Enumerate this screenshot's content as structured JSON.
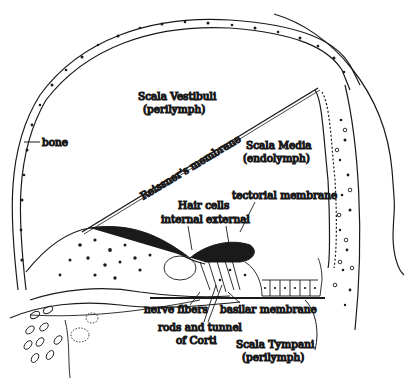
{
  "diagram": {
    "regions": {
      "scala_vestibuli": {
        "name": "Scala Vestibuli",
        "fluid": "(perilymph)"
      },
      "scala_media": {
        "name": "Scala Media",
        "fluid": "(endolymph)"
      },
      "scala_tympani": {
        "name": "Scala Tympani",
        "fluid": "(perilymph)"
      }
    },
    "labels": {
      "bone": "bone",
      "reissners_membrane": "Reissner's membrane",
      "hair_cells": "Hair cells",
      "internal": "internal",
      "external": "external",
      "tectorial_membrane": "tectorial membrane",
      "nerve_fibers": "nerve fibers",
      "rods_line1": "rods and tunnel",
      "rods_line2": "of Corti",
      "basilar_membrane": "basilar membrane"
    },
    "colors": {
      "ink": "#1a1a1a",
      "background": "#ffffff"
    }
  }
}
